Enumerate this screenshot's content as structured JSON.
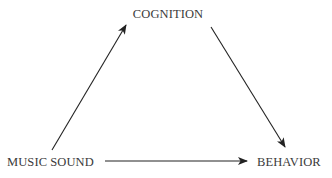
{
  "diagram": {
    "type": "triangle-flow",
    "nodes": [
      {
        "id": "cognition",
        "label": "COGNITION"
      },
      {
        "id": "music_sound",
        "label": "MUSIC SOUND"
      },
      {
        "id": "behavior",
        "label": "BEHAVIOR"
      }
    ],
    "edges": [
      {
        "from": "music_sound",
        "to": "cognition"
      },
      {
        "from": "cognition",
        "to": "behavior"
      },
      {
        "from": "music_sound",
        "to": "behavior"
      }
    ],
    "colors": {
      "text": "#3a3a3a",
      "arrow": "#222222",
      "background": "#ffffff"
    }
  }
}
